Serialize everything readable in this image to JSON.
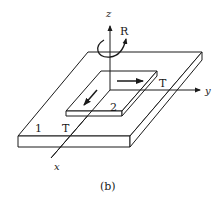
{
  "figure": {
    "caption": "(b)",
    "axes": {
      "x": "x",
      "y": "y",
      "z": "z"
    },
    "rotation_label": "R",
    "plate_large_label": "1",
    "plate_small_label": "2",
    "translation_labels": [
      "T",
      "T"
    ],
    "colors": {
      "stroke": "#1a1a1a",
      "background": "#ffffff"
    }
  }
}
